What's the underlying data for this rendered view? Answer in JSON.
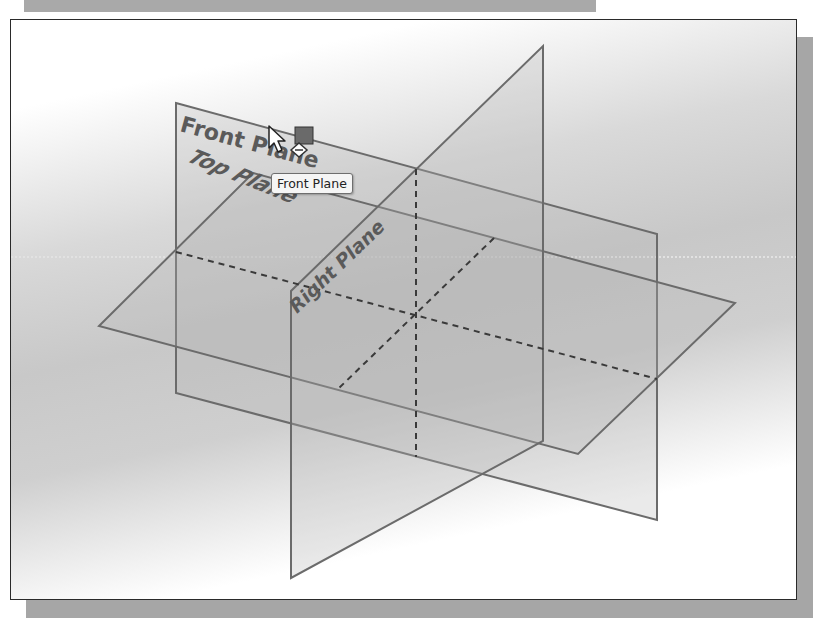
{
  "viewport": {
    "background": "gradient white-gray-white",
    "frame_color": "#2a2a2a"
  },
  "planes": [
    {
      "name": "Front Plane",
      "label": "Front Plane",
      "points": [
        [
          175,
          102
        ],
        [
          656,
          233
        ],
        [
          656,
          519
        ],
        [
          175,
          392
        ]
      ]
    },
    {
      "name": "Top Plane",
      "label": "Top Plane",
      "points": [
        [
          252,
          172
        ],
        [
          734,
          302
        ],
        [
          577,
          453
        ],
        [
          98,
          325
        ]
      ]
    },
    {
      "name": "Right Plane",
      "label": "Right Plane",
      "points": [
        [
          542,
          45
        ],
        [
          542,
          440
        ],
        [
          290,
          577
        ],
        [
          290,
          290
        ]
      ]
    }
  ],
  "labels": {
    "front_plane": "Front Plane",
    "top_plane": "Top Plane",
    "right_plane": "Right Plane"
  },
  "tooltip": {
    "text": "Front Plane"
  },
  "colors": {
    "plane_edge": "#6b6b6b",
    "plane_fill": "#bdbdbd",
    "label_text": "#5a5a5a",
    "cursor_square": "#6a6a6a",
    "shadow": "#a6a6a6"
  },
  "cursor": {
    "type": "arrow-with-plane-selection",
    "x": 268,
    "y": 125
  }
}
